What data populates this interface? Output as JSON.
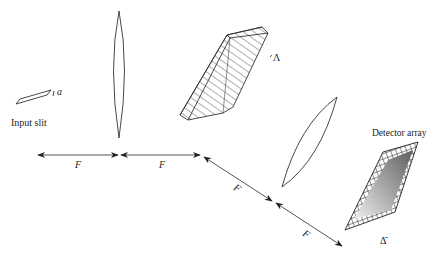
{
  "diagram": {
    "components": {
      "input_slit": {
        "label": "Input slit",
        "width_symbol": "a"
      },
      "lens1": {
        "label": ""
      },
      "grating": {
        "period_symbol": "Λ"
      },
      "lens2": {
        "label": ""
      },
      "detector": {
        "label": "Detector array",
        "pixel_symbol": "Δ̄"
      }
    },
    "distances": [
      {
        "label": "F",
        "segment": "slit-to-lens1"
      },
      {
        "label": "F",
        "segment": "lens1-to-grating"
      },
      {
        "label": "F",
        "segment": "grating-to-lens2"
      },
      {
        "label": "F",
        "segment": "lens2-to-detector"
      }
    ],
    "colors": {
      "line": "#333333",
      "arrow": "#222222",
      "detector_gradient_dark": "#6a6a6a",
      "detector_gradient_light": "#e8e8e8"
    }
  }
}
